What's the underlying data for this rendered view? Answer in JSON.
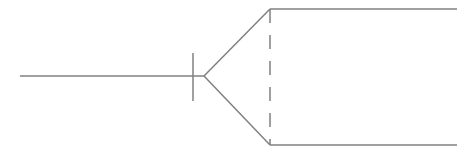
{
  "diagram": {
    "type": "crows-foot-relationship-connector",
    "stroke_color": "#808080",
    "stroke_width": 1.5,
    "background": "#ffffff",
    "input_line": {
      "x1": 20,
      "y1": 76,
      "x2": 204,
      "y2": 76
    },
    "bar_tick": {
      "x1": 193,
      "y1": 53,
      "x2": 193,
      "y2": 101
    },
    "fork_upper": {
      "x1": 204,
      "y1": 76,
      "x2": 270,
      "y2": 9
    },
    "fork_lower": {
      "x1": 204,
      "y1": 76,
      "x2": 270,
      "y2": 145
    },
    "dashed_connector": {
      "x1": 270,
      "y1": 9,
      "x2": 270,
      "y2": 145,
      "dash": "14 12"
    },
    "output_upper": {
      "x1": 270,
      "y1": 9,
      "x2": 457,
      "y2": 9
    },
    "output_lower": {
      "x1": 270,
      "y1": 145,
      "x2": 457,
      "y2": 145
    }
  }
}
